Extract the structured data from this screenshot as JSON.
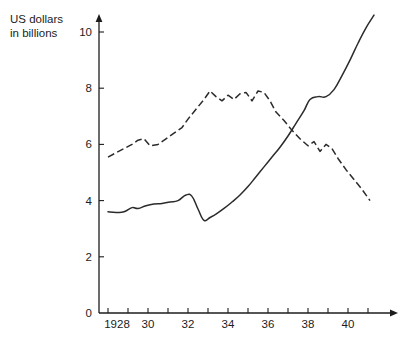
{
  "axis_title": "US dollars\nin billions",
  "colors": {
    "ink": "#1c1c1c",
    "series": "#2b2b2b",
    "background": "#ffffff"
  },
  "chart_data": {
    "type": "line",
    "title": "",
    "subtitle": "",
    "xlabel": "",
    "ylabel": "US dollars in billions",
    "xlim": [
      1928,
      1941
    ],
    "ylim": [
      0,
      10.8
    ],
    "grid": false,
    "legend": "none",
    "x_tick_labels": [
      "1928",
      "30",
      "32",
      "34",
      "36",
      "38",
      "40"
    ],
    "x_tick_values": [
      1928,
      1930,
      1932,
      1934,
      1936,
      1938,
      1940
    ],
    "x_minor_tick_values": [
      1929,
      1931,
      1933,
      1935,
      1937,
      1939,
      1941
    ],
    "y_tick_labels": [
      "0",
      "2",
      "4",
      "6",
      "8",
      "10"
    ],
    "y_tick_values": [
      0,
      2,
      4,
      6,
      8,
      10
    ],
    "origin_label": "0",
    "series": [
      {
        "name": "solid-series",
        "style": "solid",
        "x": [
          1928.0,
          1928.4,
          1928.8,
          1929.2,
          1929.5,
          1929.9,
          1930.3,
          1930.7,
          1931.1,
          1931.5,
          1931.9,
          1932.2,
          1932.5,
          1932.8,
          1933.1,
          1933.4,
          1933.8,
          1934.2,
          1934.6,
          1935.0,
          1935.4,
          1935.8,
          1936.2,
          1936.6,
          1937.0,
          1937.4,
          1937.8,
          1938.1,
          1938.5,
          1938.9,
          1939.3,
          1939.7,
          1940.1,
          1940.5,
          1940.9,
          1941.3
        ],
        "y": [
          3.6,
          3.58,
          3.6,
          3.75,
          3.72,
          3.82,
          3.88,
          3.9,
          3.95,
          4.0,
          4.2,
          4.15,
          3.7,
          3.3,
          3.4,
          3.52,
          3.72,
          3.95,
          4.2,
          4.5,
          4.85,
          5.2,
          5.55,
          5.9,
          6.3,
          6.75,
          7.2,
          7.6,
          7.7,
          7.7,
          7.95,
          8.45,
          9.0,
          9.6,
          10.15,
          10.6
        ]
      },
      {
        "name": "dashed-series",
        "style": "dashed",
        "x": [
          1928.0,
          1928.4,
          1928.8,
          1929.2,
          1929.5,
          1929.8,
          1930.1,
          1930.5,
          1930.9,
          1931.3,
          1931.7,
          1932.0,
          1932.4,
          1932.8,
          1933.1,
          1933.4,
          1933.7,
          1934.0,
          1934.3,
          1934.6,
          1934.9,
          1935.2,
          1935.5,
          1935.8,
          1936.1,
          1936.4,
          1936.8,
          1937.2,
          1937.6,
          1938.0,
          1938.3,
          1938.6,
          1938.9,
          1939.2,
          1939.5,
          1939.9,
          1940.3,
          1940.7,
          1941.1
        ],
        "y": [
          5.55,
          5.7,
          5.85,
          6.0,
          6.15,
          6.2,
          5.95,
          6.0,
          6.2,
          6.4,
          6.6,
          6.9,
          7.25,
          7.6,
          7.9,
          7.7,
          7.55,
          7.75,
          7.6,
          7.8,
          7.85,
          7.55,
          7.9,
          7.85,
          7.55,
          7.15,
          6.85,
          6.5,
          6.2,
          5.95,
          6.1,
          5.75,
          6.0,
          5.85,
          5.5,
          5.1,
          4.75,
          4.4,
          4.0
        ]
      }
    ]
  }
}
